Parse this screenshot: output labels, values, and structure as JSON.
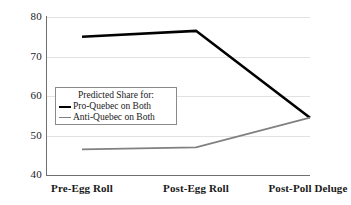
{
  "chart_data": {
    "type": "line",
    "title": "",
    "xlabel": "",
    "ylabel": "",
    "ylim": [
      40,
      80
    ],
    "yticks": [
      "40",
      "50",
      "60",
      "70",
      "80"
    ],
    "grid": true,
    "legend_position": "center-left",
    "legend_title": "Predicted Share for:",
    "categories": [
      "Pre-Egg Roll",
      "Post-Egg Roll",
      "Post-Poll Deluge"
    ],
    "series": [
      {
        "name": "Pro-Quebec on Both",
        "color": "#000000",
        "values": [
          75.0,
          76.5,
          54.5
        ]
      },
      {
        "name": "Anti-Quebec on Both",
        "color": "#808080",
        "values": [
          46.5,
          47.0,
          54.5
        ]
      }
    ]
  },
  "axis": {
    "line_color": "#6f6f6f",
    "grid_color": "#e2e2e2"
  }
}
